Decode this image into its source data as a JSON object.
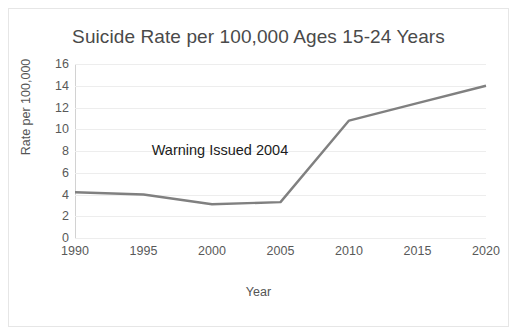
{
  "chart_data": {
    "type": "line",
    "title": "Suicide Rate per 100,000 Ages 15-24 Years",
    "xlabel": "Year",
    "ylabel": "Rate per 100,000",
    "x": [
      1990,
      1995,
      2000,
      2005,
      2010,
      2015,
      2020
    ],
    "xticklabels": [
      "1990",
      "1995",
      "2000",
      "2005",
      "2010",
      "2015",
      "2020"
    ],
    "yticklabels": [
      "0",
      "2",
      "4",
      "6",
      "8",
      "10",
      "12",
      "14",
      "16"
    ],
    "yticks": [
      0,
      2,
      4,
      6,
      8,
      10,
      12,
      14,
      16
    ],
    "xlim": [
      1990,
      2020
    ],
    "ylim": [
      0,
      16
    ],
    "grid": "horizontal",
    "legend": "none",
    "series": [
      {
        "name": "Suicide rate ages 15-24",
        "color": "#808080",
        "values": [
          4.2,
          4.0,
          3.1,
          3.3,
          10.8,
          12.4,
          14.0
        ]
      }
    ],
    "annotations": [
      {
        "text": "Warning Issued 2004",
        "x": 1995.6,
        "y": 8.0
      }
    ]
  },
  "style": {
    "line_color": "#808080",
    "grid_color": "#ededed",
    "axis_color": "#c8c8c8",
    "title_color": "#4a4a4a",
    "tick_color": "#595959",
    "annotation_color": "#1c1c1c",
    "background": "#ffffff",
    "frame_color": "#e6e6e6"
  }
}
